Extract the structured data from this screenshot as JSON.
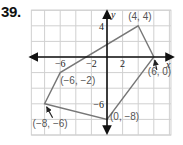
{
  "problem_number": "39.",
  "axes": {
    "x_label": "x",
    "y_label": "y",
    "x_ticks": [
      {
        "value": -6,
        "label": "−6"
      },
      {
        "value": -2,
        "label": "−2"
      },
      {
        "value": 2,
        "label": "2"
      }
    ],
    "y_ticks": [
      {
        "value": 4,
        "label": "4"
      },
      {
        "value": -6,
        "label": "−6"
      }
    ],
    "x_range": [
      -9.7,
      8.2
    ],
    "y_range": [
      -10,
      6
    ],
    "grid_step": 2
  },
  "polygon": {
    "vertices": [
      {
        "x": 4,
        "y": 4,
        "label": "(4, 4)"
      },
      {
        "x": 6,
        "y": 0,
        "label": "(6, 0)"
      },
      {
        "x": 0,
        "y": -8,
        "label": "(0, −8)"
      },
      {
        "x": -8,
        "y": -6,
        "label": "(−8, −6)"
      },
      {
        "x": -6,
        "y": -2,
        "label": "(−6, −2)"
      }
    ],
    "stroke_color": "#777777"
  },
  "colors": {
    "grid": "#d0d0d0",
    "axis": "#111111",
    "label": "#555555"
  }
}
